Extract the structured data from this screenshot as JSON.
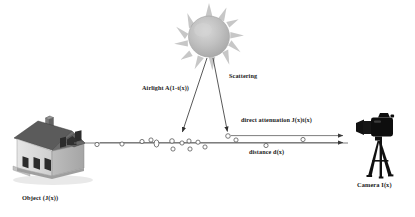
{
  "diagram": {
    "labels": {
      "airlight": "Airlight A(1-t(x))",
      "scattering": "Scattering",
      "direct_attenuation": "direct attenuation  J(x)t(x)",
      "distance": "distance d(x)",
      "object": "Object (J(x))",
      "camera": "Camera I(x)"
    },
    "objects": {
      "sun": "sun-illustration",
      "house": "house-illustration",
      "camera": "camera-tripod-illustration"
    },
    "colors": {
      "line": "#6f6f6f",
      "text": "#1a1a1a",
      "sun_body": "#b9b9b9",
      "sun_rays": "#c9c9c9",
      "roof": "#595959",
      "wall": "#d8d8d8",
      "camera": "#111111",
      "particle_stroke": "#5a5a5a",
      "background": "#ffffff"
    },
    "particles": [
      {
        "x": 97,
        "y": 144
      },
      {
        "x": 122,
        "y": 143
      },
      {
        "x": 142,
        "y": 141
      },
      {
        "x": 151,
        "y": 141
      },
      {
        "x": 168,
        "y": 141
      },
      {
        "x": 156,
        "y": 148
      },
      {
        "x": 182,
        "y": 141
      },
      {
        "x": 189,
        "y": 141
      },
      {
        "x": 172,
        "y": 149
      },
      {
        "x": 198,
        "y": 141
      },
      {
        "x": 205,
        "y": 147
      },
      {
        "x": 236,
        "y": 140
      },
      {
        "x": 198,
        "y": 136
      },
      {
        "x": 266,
        "y": 146
      },
      {
        "x": 303,
        "y": 139
      }
    ],
    "rays": [
      {
        "name": "airlight-ray",
        "x1": 207,
        "y1": 57,
        "x2": 181,
        "y2": 134
      },
      {
        "name": "scattering-ray",
        "x1": 213,
        "y1": 57,
        "x2": 228,
        "y2": 133
      }
    ],
    "beams": [
      {
        "name": "direct-attenuation-beam",
        "x1": 232,
        "y1": 136,
        "x2": 346,
        "y2": 136
      },
      {
        "name": "distance-beam",
        "x1": 100,
        "y1": 142,
        "x2": 346,
        "y2": 142
      }
    ],
    "axis": {
      "x1": 74,
      "y1": 143,
      "x2": 346,
      "y2": 143
    }
  }
}
